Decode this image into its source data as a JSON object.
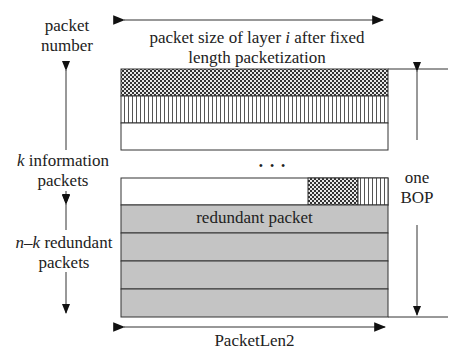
{
  "labels": {
    "y_axis_title_line1": "packet",
    "y_axis_title_line2": "number",
    "top_width_line1_pre": "packet size of layer ",
    "top_width_line1_var": "i",
    "top_width_line1_post": " after fixed",
    "top_width_line2": "length packetization",
    "info_var": "k",
    "info_line1_post": " information",
    "info_line2": "packets",
    "red_var": "n–k",
    "red_line1_post": " redundant",
    "red_line2": "packets",
    "bop_line1": "one",
    "bop_line2": "BOP",
    "ellipsis": "• • •",
    "redundant_packet": "redundant packet",
    "bottom_width": "PacketLen2"
  },
  "colors": {
    "gray_fill": "#c4c4c4",
    "line": "#333333"
  }
}
